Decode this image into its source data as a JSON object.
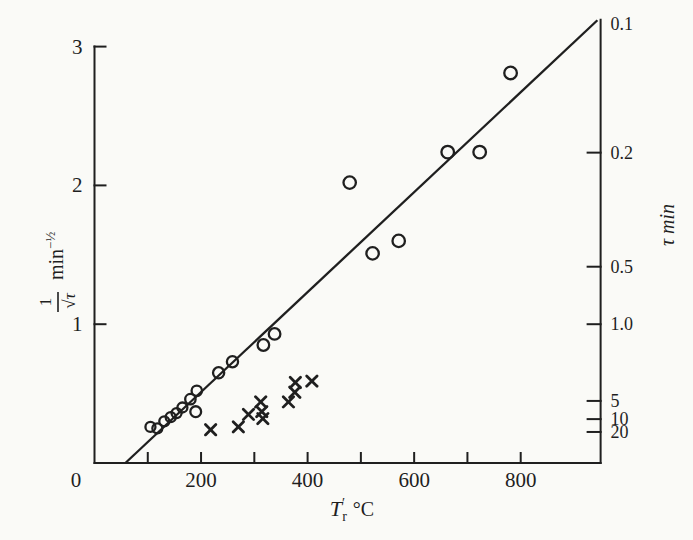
{
  "figure": {
    "paper_color": "#fafaf7",
    "ink_color": "#1f1f1f"
  },
  "chart_data": {
    "type": "scatter",
    "title": "",
    "xlabel": {
      "base": "T",
      "prime": "′",
      "sub": "r",
      "unit": "°C"
    },
    "ylabel_left": {
      "num": "1",
      "den": "√τ",
      "unit": "min",
      "sup": "−½"
    },
    "ylabel_right": {
      "text": "τ min"
    },
    "x_axis": {
      "min": 0,
      "max": 950,
      "origin_label": "0",
      "ticks": [
        {
          "v": 100,
          "label": ""
        },
        {
          "v": 200,
          "label": "200"
        },
        {
          "v": 300,
          "label": ""
        },
        {
          "v": 400,
          "label": "400"
        },
        {
          "v": 500,
          "label": ""
        },
        {
          "v": 600,
          "label": "600"
        },
        {
          "v": 700,
          "label": ""
        },
        {
          "v": 800,
          "label": "800"
        }
      ]
    },
    "y_axis_left": {
      "min": 0,
      "max": 3.0,
      "ticks": [
        {
          "v": 1,
          "label": "1"
        },
        {
          "v": 2,
          "label": "2"
        },
        {
          "v": 3,
          "label": "3"
        }
      ]
    },
    "y_axis_right": {
      "top_value": 3.193,
      "ticks": [
        {
          "tau": 0.1,
          "label": "0.1",
          "draw_tick": false
        },
        {
          "tau": 0.2,
          "label": "0.2",
          "draw_tick": true
        },
        {
          "tau": 0.5,
          "label": "0.5",
          "draw_tick": true
        },
        {
          "tau": 1.0,
          "label": "1.0",
          "draw_tick": true
        },
        {
          "tau": 5,
          "label": "5",
          "draw_tick": true
        },
        {
          "tau": 10,
          "label": "10",
          "draw_tick": true
        },
        {
          "tau": 20,
          "label": "20",
          "draw_tick": true
        }
      ]
    },
    "fit_line": {
      "x1": 58,
      "y1": 0,
      "x2": 944,
      "y2": 3.19
    },
    "series": [
      {
        "name": "circles",
        "marker": "circle",
        "points": [
          [
            105,
            0.26,
            5.0
          ],
          [
            118,
            0.25,
            5.0
          ],
          [
            131,
            0.3,
            5.0
          ],
          [
            143,
            0.33,
            5.0
          ],
          [
            154,
            0.36,
            5.0
          ],
          [
            165,
            0.4,
            5.0
          ],
          [
            180,
            0.46,
            5.2
          ],
          [
            192,
            0.52,
            5.2
          ],
          [
            190,
            0.37,
            5.4
          ],
          [
            233,
            0.65,
            5.6
          ],
          [
            259,
            0.73,
            5.6
          ],
          [
            317,
            0.85,
            5.8
          ],
          [
            338,
            0.93,
            5.8
          ],
          [
            479,
            2.02,
            6.2
          ],
          [
            522,
            1.51,
            6.2
          ],
          [
            571,
            1.6,
            6.2
          ],
          [
            663,
            2.24,
            6.3
          ],
          [
            723,
            2.24,
            6.3
          ],
          [
            781,
            2.81,
            6.3
          ]
        ]
      },
      {
        "name": "crosses",
        "marker": "x",
        "points": [
          [
            218,
            0.24
          ],
          [
            270,
            0.26
          ],
          [
            289,
            0.35
          ],
          [
            312,
            0.44
          ],
          [
            314,
            0.37
          ],
          [
            316,
            0.32
          ],
          [
            364,
            0.44
          ],
          [
            376,
            0.51
          ],
          [
            377,
            0.58
          ],
          [
            408,
            0.59
          ]
        ]
      }
    ]
  }
}
